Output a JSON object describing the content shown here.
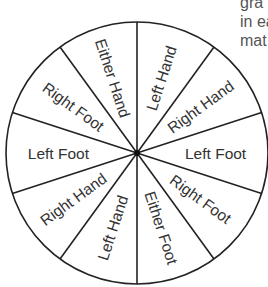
{
  "side_text": {
    "lines": [
      "gra",
      "in ea",
      "mat"
    ]
  },
  "wheel": {
    "center": [
      137,
      153
    ],
    "radius": 131,
    "stroke_color": "#222222",
    "fill_color": "#ffffff",
    "divider_start_angle_deg": 0,
    "sectors": [
      {
        "label": "Left Hand",
        "angle": 18
      },
      {
        "label": "Right Hand",
        "angle": 54
      },
      {
        "label": "Left Foot",
        "angle": 90
      },
      {
        "label": "Right Foot",
        "angle": 126
      },
      {
        "label": "Either Foot",
        "angle": 162
      },
      {
        "label": "Left Hand",
        "angle": 198
      },
      {
        "label": "Right Hand",
        "angle": 234
      },
      {
        "label": "Left Foot",
        "angle": 270
      },
      {
        "label": "Right Foot",
        "angle": 306
      },
      {
        "label": "Either Hand",
        "angle": 342
      }
    ]
  }
}
